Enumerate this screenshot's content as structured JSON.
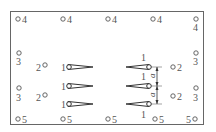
{
  "diagram": {
    "title": "",
    "colors": {
      "line": "#555555",
      "text": "#555555",
      "background": "#ffffff"
    },
    "top_row_labels": [
      "4",
      "4",
      "4",
      "4",
      "4"
    ],
    "left_column_labels": [
      "3",
      "3"
    ],
    "left_inner_labels": [
      "2",
      "2"
    ],
    "left_wedge_labels": [
      "1",
      "1",
      "1"
    ],
    "right_wedge_labels": [
      "1",
      "1",
      "1"
    ],
    "right_inner_labels": [
      "2",
      "2"
    ],
    "right_column_labels": [
      "3",
      "3"
    ],
    "bottom_row_labels": [
      "5",
      "5",
      "5",
      "5",
      "5"
    ],
    "dimension_labels": [
      "a",
      "a"
    ]
  }
}
